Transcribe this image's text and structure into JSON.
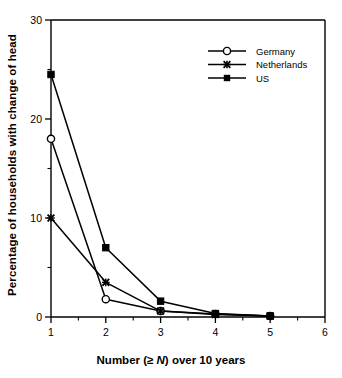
{
  "chart_data": {
    "type": "line",
    "title": "",
    "xlabel": "Number (≥ N) over 10 years",
    "xlabel_prefix": "Number (≥ ",
    "xlabel_italic": "N",
    "xlabel_suffix": ") over 10 years",
    "ylabel": "Percentage of households with change of head",
    "x": [
      1,
      2,
      3,
      4,
      5
    ],
    "xlim": [
      1,
      6
    ],
    "ylim": [
      0,
      30
    ],
    "xticks": [
      1,
      2,
      3,
      4,
      5,
      6
    ],
    "xtick_labels": [
      "1",
      "2",
      "3",
      "4",
      "5",
      "6"
    ],
    "xminor_ticks": [
      1.5,
      2.5,
      3.5,
      4.5,
      5.5
    ],
    "yticks": [
      0,
      10,
      20,
      30
    ],
    "ytick_labels": [
      "0",
      "10",
      "20",
      "30"
    ],
    "yminor_ticks": [
      5,
      15,
      25
    ],
    "grid": false,
    "legend_position": "upper right",
    "series": [
      {
        "name": "Germany",
        "marker": "open-circle",
        "color": "#000000",
        "values": [
          18.0,
          1.8,
          0.6,
          0.3,
          0.1
        ]
      },
      {
        "name": "Netherlands",
        "marker": "x-cross",
        "color": "#000000",
        "values": [
          10.0,
          3.5,
          0.6,
          0.25,
          0.1
        ]
      },
      {
        "name": "US",
        "marker": "filled-square",
        "color": "#000000",
        "values": [
          24.5,
          7.0,
          1.6,
          0.35,
          0.1
        ]
      }
    ]
  },
  "legend": {
    "entries": [
      {
        "label": "Germany"
      },
      {
        "label": "Netherlands"
      },
      {
        "label": "US"
      }
    ]
  },
  "axes": {
    "frame_color": "#000000"
  }
}
